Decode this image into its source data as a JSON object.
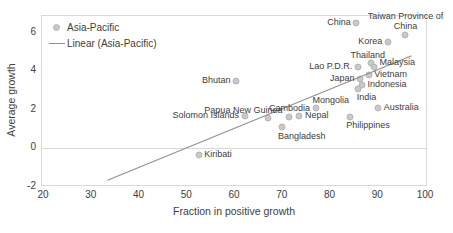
{
  "chart_data": {
    "type": "scatter",
    "title": "",
    "xlabel": "Fraction in positive growth",
    "ylabel": "Average growth",
    "xlim": [
      20,
      100
    ],
    "ylim": [
      -2,
      6
    ],
    "xticks": [
      20,
      30,
      40,
      50,
      60,
      70,
      80,
      90,
      100
    ],
    "yticks": [
      6,
      4,
      2,
      0,
      -2
    ],
    "grid": "zero-line-only",
    "legend_position": "top-left-inside",
    "legend": [
      {
        "label": "Asia-Pacific",
        "marker": "dot"
      },
      {
        "label": "Linear (Asia-Pacific)",
        "marker": "line"
      }
    ],
    "series_name": "Asia-Pacific",
    "points": [
      {
        "name": "China",
        "x": 85.4,
        "y": 6.5,
        "label_pos": "left"
      },
      {
        "name": "Taiwan Province of\nChina",
        "x": 95.7,
        "y": 5.9,
        "label_pos": "above"
      },
      {
        "name": "Korea",
        "x": 92.0,
        "y": 5.5,
        "label_pos": "left"
      },
      {
        "name": "Thailand",
        "x": 88.5,
        "y": 4.4,
        "label_pos": "above-left"
      },
      {
        "name": "Malaysia",
        "x": 89.2,
        "y": 4.2,
        "label_pos": "right-up"
      },
      {
        "name": "Lao P.D.R.",
        "x": 85.7,
        "y": 4.2,
        "label_pos": "left"
      },
      {
        "name": "Vietnam",
        "x": 88.0,
        "y": 3.8,
        "label_pos": "right"
      },
      {
        "name": "Japan",
        "x": 86.2,
        "y": 3.6,
        "label_pos": "left"
      },
      {
        "name": "Bhutan",
        "x": 60.2,
        "y": 3.5,
        "label_pos": "left"
      },
      {
        "name": "Indonesia",
        "x": 86.6,
        "y": 3.3,
        "label_pos": "right"
      },
      {
        "name": "India",
        "x": 85.7,
        "y": 3.1,
        "label_pos": "below-right"
      },
      {
        "name": "Mongolia",
        "x": 77.0,
        "y": 2.1,
        "label_pos": "above-right"
      },
      {
        "name": "Australia",
        "x": 90.0,
        "y": 2.1,
        "label_pos": "right"
      },
      {
        "name": "Solomon Islands",
        "x": 62.0,
        "y": 1.7,
        "label_pos": "left"
      },
      {
        "name": "Nepal",
        "x": 73.5,
        "y": 1.7,
        "label_pos": "right"
      },
      {
        "name": "Cambodia",
        "x": 71.4,
        "y": 1.65,
        "label_pos": "above"
      },
      {
        "name": "Philippines",
        "x": 84.0,
        "y": 1.65,
        "label_pos": "below-right"
      },
      {
        "name": "Papua New Guinea",
        "x": 67.0,
        "y": 1.6,
        "label_pos": "above-left"
      },
      {
        "name": "Bangladesh",
        "x": 69.8,
        "y": 1.1,
        "label_pos": "below-right"
      },
      {
        "name": "Kiribati",
        "x": 52.4,
        "y": -0.35,
        "label_pos": "right"
      }
    ],
    "trendline": {
      "x1": 33.3,
      "y1": -1.65,
      "x2": 97.0,
      "y2": 4.8
    },
    "colors": {
      "marker_fill": "#c9c9c9",
      "marker_stroke": "#b5b5b5",
      "trend_line": "#919191",
      "text": "#404040",
      "plot_border": "#d9d9d9",
      "background": "#ffffff"
    }
  }
}
